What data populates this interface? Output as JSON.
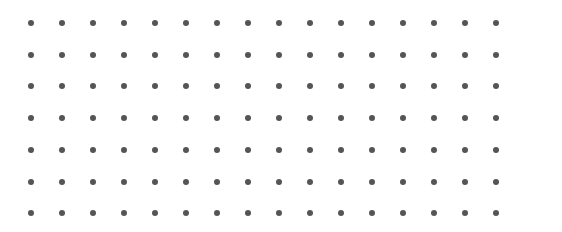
{
  "dot_grid": {
    "columns": 16,
    "rows": 7,
    "x_start": 31,
    "x_step": 31,
    "y_start": 23,
    "y_step": 31.7,
    "dot_diameter": 6,
    "dot_color": "#555555",
    "background": "#ffffff"
  }
}
